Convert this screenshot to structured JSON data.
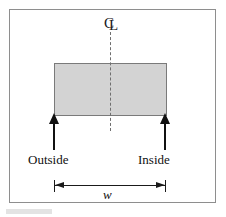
{
  "figure": {
    "frame": {
      "border_color": "#8e8e8e"
    },
    "section": {
      "name": "shaded-rectangular-section",
      "fill_color": "#d3d3d3",
      "stroke_color": "#7a7a7a"
    },
    "centerline": {
      "symbol_c": "C",
      "symbol_l": "L",
      "style": "dash-dot",
      "color": "#6f6f6f"
    },
    "labels": {
      "outside": "Outside",
      "inside": "Inside",
      "width": "w"
    },
    "arrows": {
      "outside_arrow": "up-arrow",
      "inside_arrow": "up-arrow",
      "color": "#111111"
    },
    "dimension": {
      "symbol": "w",
      "arrow_style": "double-headed",
      "color": "#1a1a1a"
    },
    "caption_fragment": ""
  }
}
